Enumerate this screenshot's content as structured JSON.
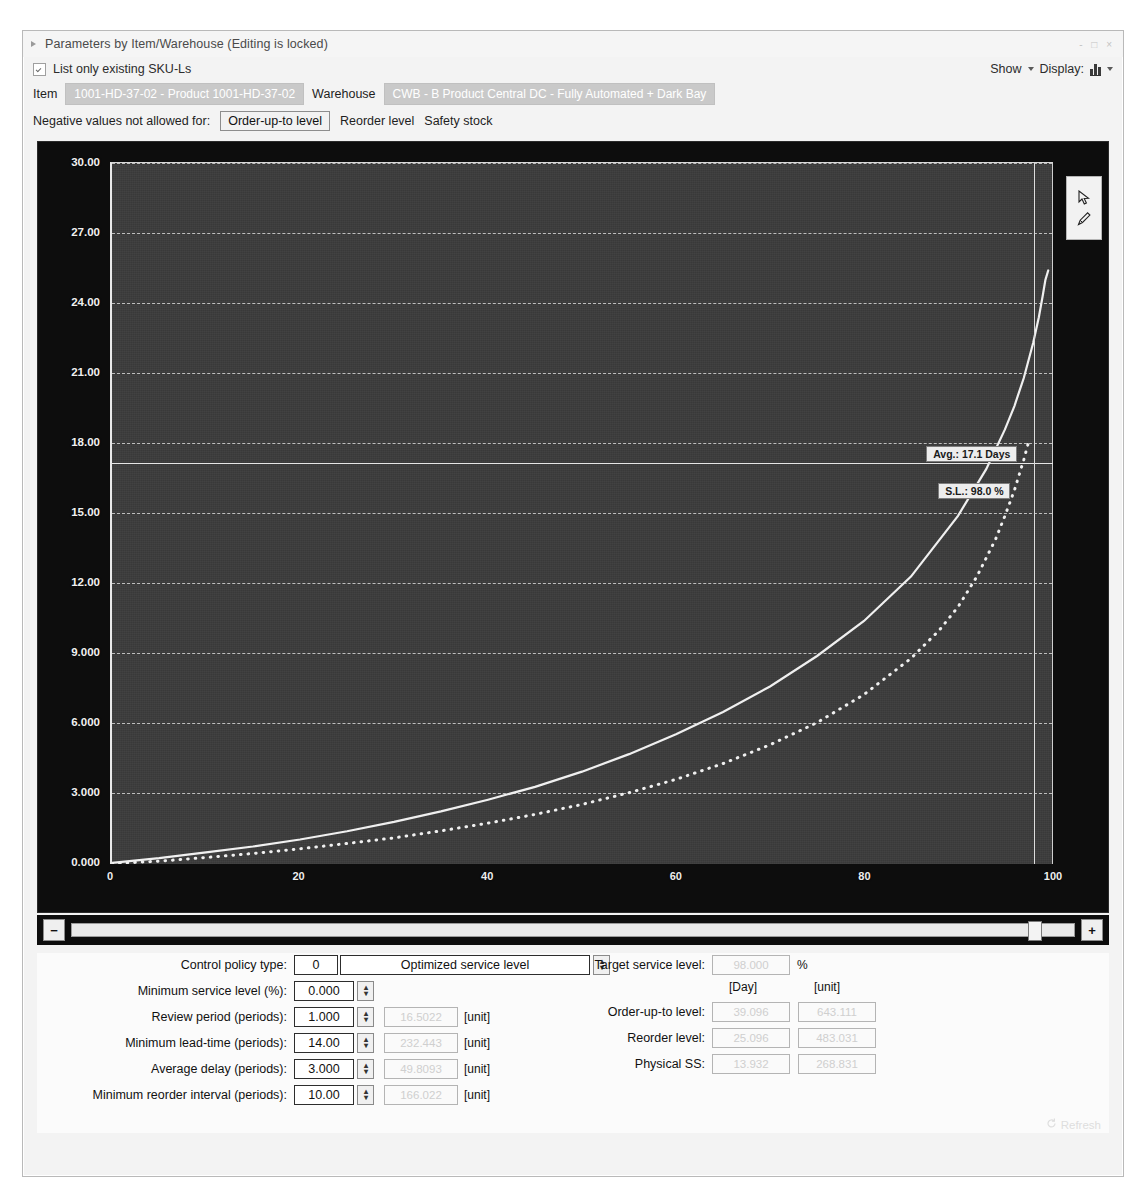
{
  "window": {
    "title": "Parameters by Item/Warehouse (Editing is locked)",
    "expander_icon": "triangle-right-icon",
    "window_controls": "- □ ×"
  },
  "header": {
    "list_only_checkbox_label": "List only existing SKU-Ls",
    "list_only_checked": true,
    "show_label": "Show",
    "display_label": "Display:",
    "display_icon": "bar-chart-icon",
    "item_label": "Item",
    "item_value": "1001-HD-37-02 - Product 1001-HD-37-02",
    "warehouse_label": "Warehouse",
    "warehouse_value": "CWB - B Product Central DC - Fully Automated + Dark Bay",
    "negative_label": "Negative values not allowed for:",
    "negative_options": [
      "Order-up-to level",
      "Reorder level",
      "Safety stock"
    ],
    "negative_selected": "Order-up-to level"
  },
  "chart_tools": {
    "pointer_icon": "cursor-pointer-icon",
    "pencil_icon": "pencil-icon"
  },
  "slider": {
    "minus_label": "−",
    "plus_label": "+",
    "thumb_position_pct": 96
  },
  "chart_data": {
    "type": "line",
    "title": "",
    "xlabel": "",
    "ylabel": "",
    "xlim": [
      0,
      100
    ],
    "ylim": [
      0,
      30
    ],
    "grid": true,
    "legend_position": "none",
    "xticks": [
      "0",
      "20",
      "40",
      "60",
      "80",
      "100"
    ],
    "yticks": [
      "0.000",
      "3.000",
      "6.000",
      "9.000",
      "12.00",
      "15.00",
      "18.00",
      "21.00",
      "24.00",
      "27.00",
      "30.00"
    ],
    "annotations": [
      {
        "name": "avg-line-label",
        "text": "Avg.: 17.1 Days",
        "y": 17.1
      },
      {
        "name": "service-level-label",
        "text": "S.L.: 98.0 %",
        "x": 98.0
      }
    ],
    "series": [
      {
        "name": "solid-curve",
        "style": "solid",
        "x": [
          0,
          5,
          10,
          15,
          20,
          25,
          30,
          35,
          40,
          45,
          50,
          55,
          60,
          65,
          70,
          75,
          80,
          85,
          90,
          93,
          95,
          96,
          97,
          98,
          98.6,
          99,
          99.3,
          99.6
        ],
        "y": [
          0.05,
          0.25,
          0.5,
          0.75,
          1.05,
          1.4,
          1.8,
          2.25,
          2.75,
          3.3,
          3.95,
          4.7,
          5.55,
          6.5,
          7.6,
          8.9,
          10.4,
          12.3,
          14.9,
          16.9,
          18.6,
          19.6,
          20.8,
          22.3,
          23.4,
          24.3,
          25.0,
          25.4
        ]
      },
      {
        "name": "dotted-curve",
        "style": "dotted",
        "x": [
          0,
          5,
          10,
          15,
          20,
          25,
          30,
          35,
          40,
          45,
          50,
          55,
          60,
          65,
          70,
          75,
          80,
          85,
          88,
          90,
          92,
          94,
          95,
          96,
          97,
          97.6
        ],
        "y": [
          0.02,
          0.12,
          0.28,
          0.45,
          0.65,
          0.88,
          1.12,
          1.42,
          1.75,
          2.12,
          2.55,
          3.05,
          3.62,
          4.3,
          5.1,
          6.05,
          7.25,
          8.8,
          10.0,
          11.0,
          12.3,
          13.9,
          14.9,
          16.0,
          17.3,
          18.2
        ]
      }
    ]
  },
  "form": {
    "control_policy_label": "Control policy type:",
    "control_policy_code": "0",
    "control_policy_name": "Optimized service level",
    "left_rows": [
      {
        "label": "Minimum service level (%):",
        "value": "0.000",
        "dim": "",
        "unit": ""
      },
      {
        "label": "Review period (periods):",
        "value": "1.000",
        "dim": "16.5022",
        "unit": "[unit]"
      },
      {
        "label": "Minimum lead-time (periods):",
        "value": "14.00",
        "dim": "232.443",
        "unit": "[unit]"
      },
      {
        "label": "Average delay (periods):",
        "value": "3.000",
        "dim": "49.8093",
        "unit": "[unit]"
      },
      {
        "label": "Minimum reorder interval (periods):",
        "value": "10.00",
        "dim": "166.022",
        "unit": "[unit]"
      }
    ],
    "target_service_level_label": "Target service level:",
    "target_service_level_value": "98.000",
    "target_service_level_unit": "%",
    "col_day": "[Day]",
    "col_unit": "[unit]",
    "right_rows": [
      {
        "label": "Order-up-to level:",
        "day": "39.096",
        "unit": "643.111"
      },
      {
        "label": "Reorder level:",
        "day": "25.096",
        "unit": "483.031"
      },
      {
        "label": "Physical SS:",
        "day": "13.932",
        "unit": "268.831"
      }
    ],
    "refresh_label": "Refresh",
    "refresh_icon": "refresh-icon"
  },
  "colors": {
    "plot_background": "#3b3b3b",
    "chart_frame": "#0d0d0d",
    "axis": "#e8e8e8",
    "curve": "#f0f0f0",
    "readonly_field_bg": "#c9c9c9"
  }
}
